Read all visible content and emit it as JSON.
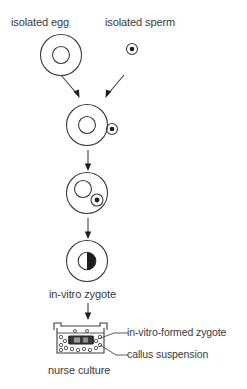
{
  "diagram": {
    "title_hidden": "",
    "labels": {
      "isolated_egg": "isolated egg",
      "isolated_sperm": "isolated sperm",
      "in_vitro_zygote": "in-vitro zygote",
      "in_vitro_formed_zygote": "in-vitro-formed zygote",
      "callus_suspension": "callus suspension",
      "nurse_culture": "nurse culture"
    },
    "colors": {
      "stroke": "#3c3c3c",
      "fill_dark": "#1d1d1d",
      "background": "#ffffff",
      "text": "#3a3a3a"
    },
    "stages": [
      {
        "name": "isolated-egg",
        "description": "egg cell with central nucleus"
      },
      {
        "name": "isolated-sperm",
        "description": "small sperm cell with dark nucleus"
      },
      {
        "name": "sperm-attached",
        "description": "sperm adhering to egg surface"
      },
      {
        "name": "sperm-internalized",
        "description": "sperm inside egg contacting nucleus"
      },
      {
        "name": "fused-zygote",
        "description": "zygote with half-darkened fusion nucleus"
      },
      {
        "name": "nurse-culture-vessel",
        "description": "culture dish with callus suspension and zygote chamber"
      }
    ]
  }
}
